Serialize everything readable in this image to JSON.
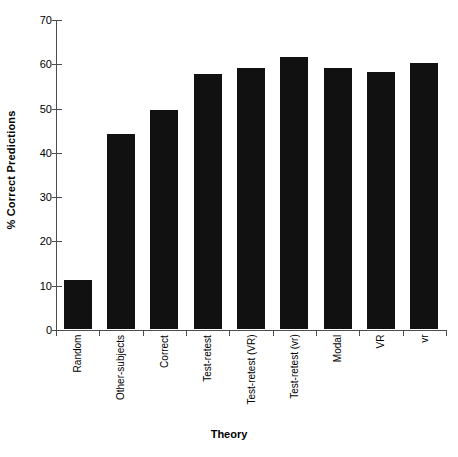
{
  "chart_data": {
    "type": "bar",
    "title": "",
    "xlabel": "Theory",
    "ylabel": "% Correct Predictions",
    "categories": [
      "Random",
      "Other-subjects",
      "Correct",
      "Test-retest",
      "Test-retest (VR)",
      "Test-retest (vr)",
      "Modal",
      "VR",
      "vr"
    ],
    "values": [
      11,
      44,
      49.5,
      57.5,
      59,
      61.5,
      59,
      58,
      60
    ],
    "ylim": [
      0,
      70
    ],
    "ytick_labels": [
      "0",
      "10",
      "20",
      "30",
      "40",
      "50",
      "60",
      "70"
    ],
    "ytick_values": [
      0,
      10,
      20,
      30,
      40,
      50,
      60,
      70
    ],
    "ytick_step": 10,
    "grid": false,
    "legend": null,
    "bar_color": "#111111",
    "axis_color": "#4d4d4d",
    "background_color": "#ffffff"
  }
}
